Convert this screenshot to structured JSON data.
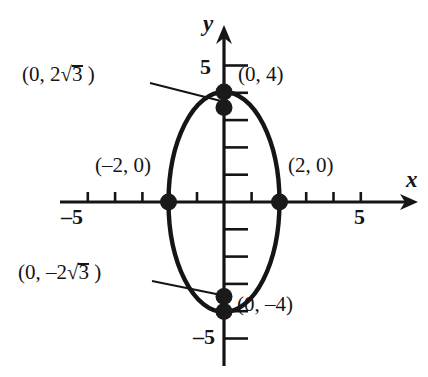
{
  "figure": {
    "kind": "ellipse-graph"
  },
  "axes": {
    "x_label": "x",
    "y_label": "y",
    "x_tick_label_negative": "–5",
    "x_tick_label_positive": "5",
    "y_tick_label_positive": "5",
    "y_tick_label_negative": "–5",
    "origin_px": [
      224,
      202
    ],
    "unit_px": 27.3,
    "x_range": [
      -6,
      6.9
    ],
    "y_range": [
      -6,
      6.5
    ],
    "line_color": "#151515"
  },
  "curve": {
    "type": "ellipse",
    "center": [
      0,
      0
    ],
    "semi_axis_x": 2,
    "semi_axis_y": 4,
    "stroke_color": "#151515",
    "stroke_width": 4.2
  },
  "points": [
    {
      "name": "top-vertex",
      "x": 0,
      "y": 4,
      "label": "(0, 4)"
    },
    {
      "name": "upper-inner",
      "x": 0,
      "y": 3.464,
      "label": "(0, 2√3 )"
    },
    {
      "name": "left-vertex",
      "x": -2,
      "y": 0,
      "label": "(–2, 0)"
    },
    {
      "name": "right-vertex",
      "x": 2,
      "y": 0,
      "label": "(2, 0)"
    },
    {
      "name": "lower-inner",
      "x": 0,
      "y": -3.464,
      "label": "(0, –2√3 )"
    },
    {
      "name": "bottom-vertex",
      "x": 0,
      "y": -4,
      "label": "(0, –4)"
    }
  ],
  "annotations": {
    "upper_sqrt": {
      "prefix": "(0, 2",
      "radical": "√",
      "radicand": "3",
      "suffix": " )"
    },
    "lower_sqrt": {
      "prefix": "(0, –2",
      "radical": "√",
      "radicand": "3",
      "suffix": " )"
    },
    "point_04": "(0, 4)",
    "point_0m4": "(0, –4)",
    "point_m20": "(–2, 0)",
    "point_20": "(2, 0)"
  },
  "colors": {
    "background": "#ffffff",
    "ink": "#151515",
    "dot": "#1a1a1a"
  }
}
